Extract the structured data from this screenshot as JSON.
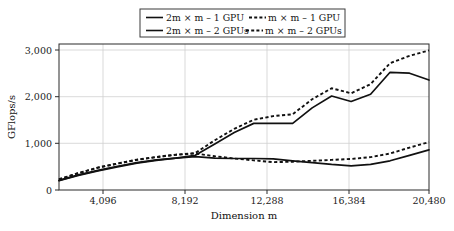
{
  "chart_data": {
    "type": "line",
    "title": "",
    "xlabel": "Dimension m",
    "ylabel": "GFlops/s",
    "xlim": [
      1024,
      20480
    ],
    "ylim": [
      0,
      3200
    ],
    "grid": true,
    "legend_position": "top-center",
    "xticks": [
      4096,
      8192,
      12288,
      16384,
      20480
    ],
    "xtick_labels": [
      "4,096",
      "8,192",
      "12,288",
      "16,384",
      "20,480"
    ],
    "yticks": [
      0,
      1000,
      2000,
      3000
    ],
    "ytick_labels": [
      "0",
      "1,000",
      "2,000",
      "3,000"
    ],
    "x": [
      1024,
      2048,
      3072,
      4096,
      5120,
      6144,
      7168,
      8192,
      9216,
      10240,
      11264,
      12288,
      13312,
      14336,
      15360,
      16384,
      17408,
      18432,
      19456,
      20480
    ],
    "series": [
      {
        "name": "2m × m – 1 GPU",
        "style": "solid",
        "values": [
          210,
          330,
          430,
          520,
          600,
          660,
          700,
          730,
          700,
          690,
          690,
          680,
          640,
          600,
          560,
          530,
          560,
          640,
          760,
          880
        ]
      },
      {
        "name": "m × m – 1 GPU",
        "style": "dashed",
        "values": [
          235,
          370,
          490,
          580,
          660,
          720,
          770,
          800,
          740,
          690,
          650,
          610,
          620,
          640,
          660,
          680,
          720,
          800,
          930,
          1050
        ]
      },
      {
        "name": "2m × m – 2 GPUs",
        "style": "solid",
        "values": [
          205,
          320,
          420,
          505,
          590,
          650,
          700,
          760,
          1010,
          1260,
          1460,
          1460,
          1460,
          1800,
          2060,
          1940,
          2100,
          2580,
          2560,
          2410
        ]
      },
      {
        "name": "m × m – 2 GPUs",
        "style": "dashed",
        "values": [
          235,
          370,
          490,
          580,
          665,
          725,
          775,
          810,
          1090,
          1340,
          1540,
          1620,
          1660,
          1990,
          2230,
          2120,
          2320,
          2780,
          2940,
          3060
        ]
      }
    ]
  },
  "legend": {
    "entries": [
      {
        "label": "2m × m – 1 GPU",
        "style": "solid"
      },
      {
        "label": "m × m – 1 GPU",
        "style": "dashed"
      },
      {
        "label": "2m × m – 2 GPUs",
        "style": "solid"
      },
      {
        "label": "m × m – 2 GPUs",
        "style": "dashed"
      }
    ]
  },
  "colors": {
    "line": "#111111",
    "grid": "#cfcfcf",
    "frame": "#2b2b2b",
    "background": "#ffffff"
  }
}
